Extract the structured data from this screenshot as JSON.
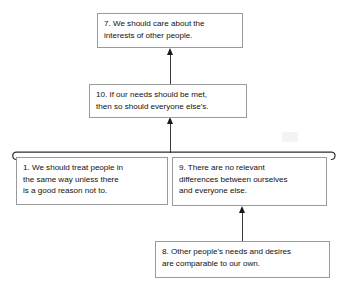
{
  "diagram": {
    "type": "argument-map",
    "background_color": "#ffffff",
    "box_border_color": "#9a9a9a",
    "arrow_color": "#1a1a1a",
    "text_color": "#111111",
    "nodes": [
      {
        "id": "7",
        "name": "conclusion",
        "lines": [
          "7. We should care about the",
          "interests of other people."
        ]
      },
      {
        "id": "10",
        "name": "intermediate-conclusion",
        "lines": [
          "10. If our needs should be met,",
          "then so should everyone else's."
        ]
      },
      {
        "id": "1",
        "name": "premise-left",
        "lines": [
          "1. We should treat people in",
          "the same way unless there",
          "is a good reason not to."
        ]
      },
      {
        "id": "9",
        "name": "premise-right",
        "lines": [
          "9. There are no relevant",
          "differences between ourselves",
          "and everyone else."
        ]
      },
      {
        "id": "8",
        "name": "supporting-premise",
        "lines": [
          "8. Other people's needs and desires",
          "are comparable to our own."
        ]
      }
    ],
    "connections": [
      {
        "from": "10",
        "to": "7",
        "style": "arrow-up"
      },
      {
        "from": "bracket-1-9",
        "to": "10",
        "style": "arrow-up"
      },
      {
        "from": "8",
        "to": "9",
        "style": "arrow-up"
      }
    ],
    "bracket": {
      "name": "joint-premise-bracket",
      "groups": [
        "1",
        "9"
      ],
      "style": "curled-ends"
    }
  }
}
